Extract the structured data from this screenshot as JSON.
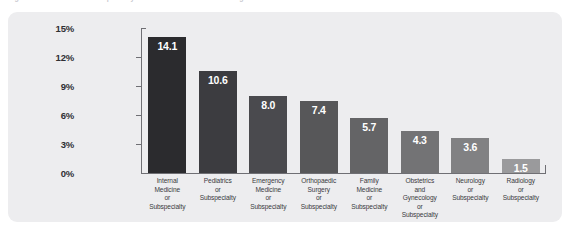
{
  "top_strip": {
    "fragments": [
      "Figure",
      "Specialty",
      "Percentage",
      "Residents"
    ]
  },
  "panel": {
    "background_color": "#ededef",
    "axis_color": "#6f6f74"
  },
  "chart_data": {
    "type": "bar",
    "title": "",
    "xlabel": "",
    "ylabel": "",
    "ylim": [
      0,
      15
    ],
    "grid": false,
    "legend": "none",
    "value_label_position": "inside-top",
    "ytick_labels": [
      "15%",
      "12%",
      "9%",
      "6%",
      "3%",
      "0%"
    ],
    "ytick_values": [
      15,
      12,
      9,
      6,
      3,
      0
    ],
    "categories": [
      "Internal Medicine or Subspecialty",
      "Pediatrics or Subspecialty",
      "Emergency Medicine or Subspecialty",
      "Orthopaedic Surgery or Subspecialty",
      "Family Medicine or Subspecialty",
      "Obstetrics and Gynecology or Subspecialty",
      "Neurology or Subspecialty",
      "Radiology or Subspecialty"
    ],
    "category_lines": [
      [
        "Internal",
        "Medicine",
        "or",
        "Subspecialty"
      ],
      [
        "Pediatrics",
        "or",
        "Subspecialty"
      ],
      [
        "Emergency",
        "Medicine",
        "or",
        "Subspecialty"
      ],
      [
        "Orthopaedic",
        "Surgery",
        "or",
        "Subspecialty"
      ],
      [
        "Family",
        "Medicine",
        "or",
        "Subspecialty"
      ],
      [
        "Obstetrics",
        "and",
        "Gynecology",
        "or",
        "Subspecialty"
      ],
      [
        "Neurology",
        "or",
        "Subspecialty"
      ],
      [
        "Radiology",
        "or",
        "Subspecialty"
      ]
    ],
    "values": [
      14.1,
      10.6,
      8.0,
      7.4,
      5.7,
      4.3,
      3.6,
      1.5
    ],
    "value_labels": [
      "14.1",
      "10.6",
      "8.0",
      "7.4",
      "5.7",
      "4.3",
      "3.6",
      "1.5"
    ],
    "bar_colors": [
      "#2b2b2e",
      "#3c3c40",
      "#4a4a4e",
      "#575759",
      "#646466",
      "#737375",
      "#818183",
      "#9a9a9c"
    ]
  }
}
